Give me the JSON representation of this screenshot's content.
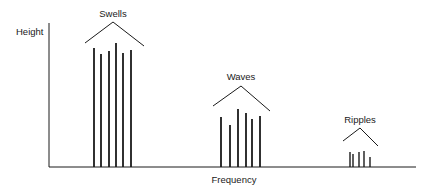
{
  "diagram": {
    "y_axis_label": "Height",
    "x_axis_label": "Frequency",
    "colors": {
      "ink": "#1a1a1a",
      "background": "#ffffff"
    },
    "groups": [
      {
        "label": "Swells",
        "bars": [
          {
            "x": 94,
            "top": 48
          },
          {
            "x": 101,
            "top": 54
          },
          {
            "x": 109,
            "top": 51
          },
          {
            "x": 116,
            "top": 43
          },
          {
            "x": 123,
            "top": 53
          },
          {
            "x": 131,
            "top": 50
          }
        ],
        "bracket": {
          "left": [
            85,
            43
          ],
          "apex": [
            113,
            22
          ],
          "right": [
            144,
            46
          ]
        },
        "label_pos": [
          113,
          17
        ]
      },
      {
        "label": "Waves",
        "bars": [
          {
            "x": 221,
            "top": 117
          },
          {
            "x": 230,
            "top": 125
          },
          {
            "x": 238,
            "top": 109
          },
          {
            "x": 246,
            "top": 113
          },
          {
            "x": 252,
            "top": 119
          },
          {
            "x": 260,
            "top": 116
          }
        ],
        "bracket": {
          "left": [
            213,
            106
          ],
          "apex": [
            241,
            86
          ],
          "right": [
            270,
            111
          ]
        },
        "label_pos": [
          241,
          80
        ]
      },
      {
        "label": "Ripples",
        "bars": [
          {
            "x": 350,
            "top": 152
          },
          {
            "x": 353,
            "top": 154
          },
          {
            "x": 359,
            "top": 152
          },
          {
            "x": 364,
            "top": 151
          },
          {
            "x": 370,
            "top": 157
          }
        ],
        "bracket": {
          "left": [
            343,
            141
          ],
          "apex": [
            360,
            128
          ],
          "right": [
            378,
            146
          ]
        },
        "label_pos": [
          360,
          123
        ]
      }
    ]
  }
}
